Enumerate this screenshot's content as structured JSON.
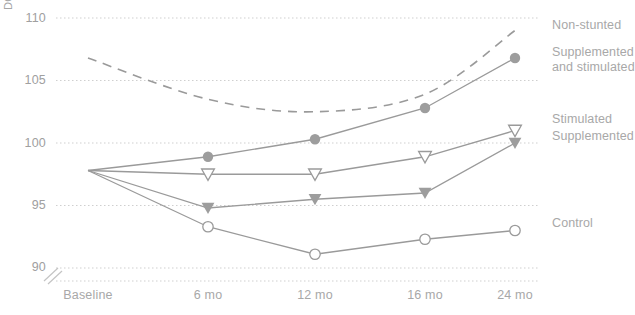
{
  "chart_data": {
    "type": "line",
    "title": "",
    "xlabel": "",
    "ylabel": "DQ",
    "categories": [
      "Baseline",
      "6 mo",
      "12 mo",
      "16 mo",
      "24 mo"
    ],
    "x": [
      0,
      6,
      12,
      16,
      24
    ],
    "ylim": [
      90,
      110
    ],
    "yticks": [
      90,
      95,
      100,
      105,
      110
    ],
    "grid": true,
    "axis_break": true,
    "legend_position": "right",
    "series": [
      {
        "name": "Non-stunted",
        "marker": "none",
        "linestyle": "dashed",
        "color": "#9a9a9a",
        "categories": [
          "Baseline",
          "6 mo",
          "12 mo",
          "16 mo",
          "24 mo"
        ],
        "values": [
          106.8,
          103.5,
          102.5,
          103.9,
          109.0
        ]
      },
      {
        "name": "Supplemented and stimulated",
        "marker": "filled-circle",
        "linestyle": "solid",
        "color": "#9a9a9a",
        "categories": [
          "Baseline",
          "6 mo",
          "12 mo",
          "16 mo",
          "24 mo"
        ],
        "values": [
          97.8,
          98.9,
          100.3,
          102.8,
          106.8
        ]
      },
      {
        "name": "Stimulated",
        "marker": "open-triangle-down",
        "linestyle": "solid",
        "color": "#9a9a9a",
        "categories": [
          "Baseline",
          "6 mo",
          "12 mo",
          "16 mo",
          "24 mo"
        ],
        "values": [
          97.8,
          97.5,
          97.5,
          98.9,
          101.0
        ]
      },
      {
        "name": "Supplemented",
        "marker": "filled-triangle-down",
        "linestyle": "solid",
        "color": "#9a9a9a",
        "categories": [
          "Baseline",
          "6 mo",
          "12 mo",
          "16 mo",
          "24 mo"
        ],
        "values": [
          97.8,
          94.8,
          95.5,
          96.0,
          100.0
        ]
      },
      {
        "name": "Control",
        "marker": "open-circle",
        "linestyle": "solid",
        "color": "#9a9a9a",
        "categories": [
          "Baseline",
          "6 mo",
          "12 mo",
          "16 mo",
          "24 mo"
        ],
        "values": [
          97.8,
          93.3,
          91.1,
          92.3,
          93.0
        ]
      }
    ]
  },
  "axis": {
    "y_title": "DQ",
    "y_tick_labels": [
      "110",
      "105",
      "100",
      "95",
      "90"
    ],
    "x_tick_labels": [
      "Baseline",
      "6 mo",
      "12 mo",
      "16 mo",
      "24 mo"
    ]
  },
  "legend": {
    "entries": [
      {
        "label": "Non-stunted"
      },
      {
        "label_line1": "Supplemented",
        "label_line2": "and stimulated"
      },
      {
        "label": "Stimulated"
      },
      {
        "label": "Supplemented"
      },
      {
        "label": "Control"
      }
    ]
  },
  "colors": {
    "line": "#9a9a9a",
    "marker_fill": "#9d9d9d",
    "marker_open_fill": "#ffffff",
    "grid": "#cfcfcf",
    "text": "#a6a6a6"
  }
}
